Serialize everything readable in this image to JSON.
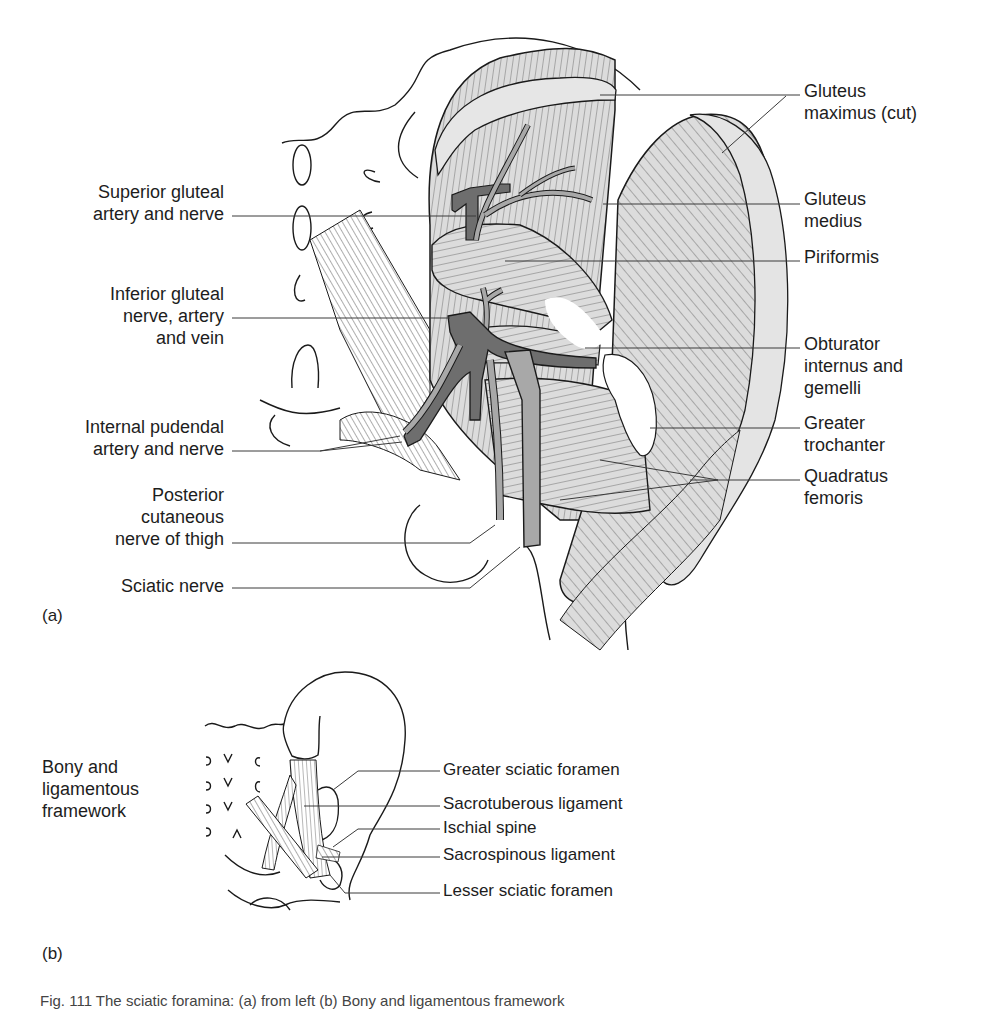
{
  "figure": {
    "panel_a_tag": "(a)",
    "panel_b_tag": "(b)",
    "caption_partial": "Fig. 111 The sciatic foramina: (a) from left (b) Bony and ligamentous framework",
    "colors": {
      "background": "#ffffff",
      "outline": "#1a1a1a",
      "muscle_fill": "#dcdcdc",
      "artery_vein_fill": "#6e6e6e",
      "nerve_fill": "#a8a8a8",
      "leader_line": "#3a3a3a"
    }
  },
  "panel_a": {
    "left_labels": [
      {
        "lines": [
          "Superior gluteal",
          "artery and nerve"
        ]
      },
      {
        "lines": [
          "Inferior gluteal",
          "nerve, artery",
          "and vein"
        ]
      },
      {
        "lines": [
          "Internal pudendal",
          "artery and nerve"
        ]
      },
      {
        "lines": [
          "Posterior",
          "cutaneous",
          "nerve of thigh"
        ]
      },
      {
        "lines": [
          "Sciatic nerve"
        ]
      }
    ],
    "right_labels": [
      {
        "lines": [
          "Gluteus",
          "maximus (cut)"
        ]
      },
      {
        "lines": [
          "Gluteus",
          "medius"
        ]
      },
      {
        "lines": [
          "Piriformis"
        ]
      },
      {
        "lines": [
          "Obturator",
          "internus and",
          "gemelli"
        ]
      },
      {
        "lines": [
          "Greater",
          "trochanter"
        ]
      },
      {
        "lines": [
          "Quadratus",
          "femoris"
        ]
      }
    ]
  },
  "panel_b": {
    "side_title": [
      "Bony and",
      "ligamentous",
      "framework"
    ],
    "labels": [
      "Greater sciatic foramen",
      "Sacrotuberous ligament",
      "Ischial spine",
      "Sacrospinous ligament",
      "Lesser sciatic foramen"
    ]
  }
}
